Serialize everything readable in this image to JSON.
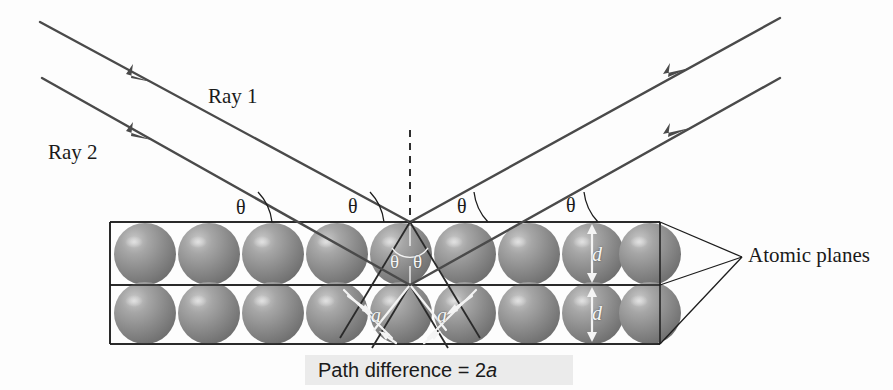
{
  "figure": {
    "background_color": "#fdfdfd",
    "sphere_color": "#8a8a8a",
    "ray_color": "#4a4a4a",
    "line_color": "#1d1d1d"
  },
  "labels": {
    "ray1": "Ray 1",
    "ray2": "Ray 2",
    "atomic_planes": "Atomic planes",
    "caption_prefix": "Path difference = 2",
    "caption_symbol": "a"
  },
  "angles": {
    "symbol": "θ",
    "above_plane": [
      {
        "id": "incident-ray1",
        "x": 236,
        "y": 197
      },
      {
        "id": "incident-ray2",
        "x": 348,
        "y": 196
      },
      {
        "id": "reflected-ray1",
        "x": 457,
        "y": 196
      },
      {
        "id": "reflected-ray2",
        "x": 566,
        "y": 195
      }
    ],
    "below_plane": [
      {
        "id": "interior-left",
        "x": 390,
        "y": 252
      },
      {
        "id": "interior-right",
        "x": 413,
        "y": 252
      }
    ]
  },
  "dimensions": {
    "spacing_symbol": "d",
    "spacing_markers": [
      {
        "id": "d-upper-row",
        "x": 592,
        "y": 244
      },
      {
        "id": "d-lower-row",
        "x": 592,
        "y": 303
      }
    ],
    "path_symbol": "a",
    "path_markers": [
      {
        "id": "a-left",
        "x": 371,
        "y": 305
      },
      {
        "id": "a-right",
        "x": 437,
        "y": 305
      }
    ]
  },
  "crystal": {
    "rows": 2,
    "spheres_per_row": 9,
    "first_center_x": 145,
    "sphere_spacing": 64,
    "sphere_radius": 31,
    "row1_center_y": 254,
    "row2_center_y": 313,
    "plane_y": [
      222,
      285,
      344
    ],
    "left_x": 110,
    "right_x": 660
  },
  "rays": {
    "incident": [
      {
        "id": "ray-1-incident",
        "x1": 40,
        "y1": 22,
        "x2": 410,
        "y2": 222
      },
      {
        "id": "ray-2-incident",
        "x1": 42,
        "y1": 78,
        "x2": 410,
        "y2": 285
      }
    ],
    "reflected": [
      {
        "id": "ray-1-reflected",
        "x1": 410,
        "y1": 222,
        "x2": 780,
        "y2": 18
      },
      {
        "id": "ray-2-reflected",
        "x1": 410,
        "y1": 285,
        "x2": 780,
        "y2": 78
      }
    ],
    "normal": {
      "id": "surface-normal",
      "x": 410,
      "y1": 130,
      "y2": 290
    }
  }
}
